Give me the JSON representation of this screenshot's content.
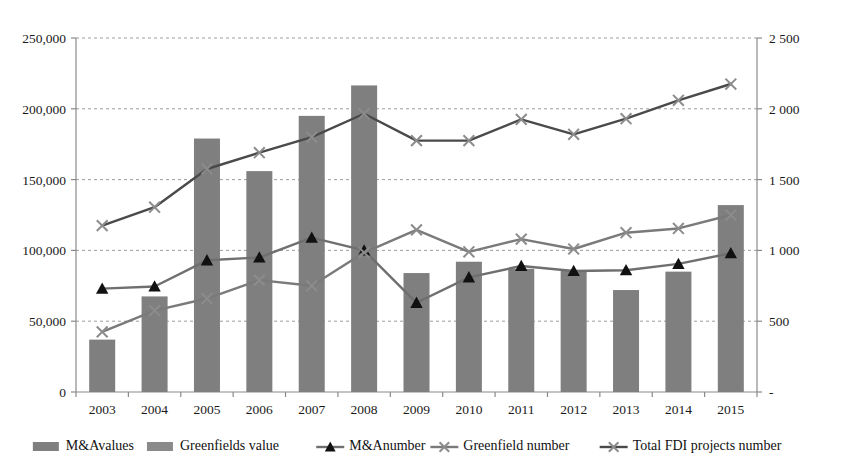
{
  "chart_data": {
    "type": "bar",
    "title": "",
    "subtitle": "",
    "xlabel": "",
    "ylabel": "",
    "grid": true,
    "legend_position": "bottom",
    "categories": [
      "2003",
      "2004",
      "2005",
      "2006",
      "2007",
      "2008",
      "2009",
      "2010",
      "2011",
      "2012",
      "2013",
      "2014",
      "2015"
    ],
    "axes": {
      "left": {
        "label": "",
        "ylim": [
          0,
          250000
        ],
        "ticks": [
          0,
          50000,
          100000,
          150000,
          200000,
          250000
        ],
        "tick_labels": [
          "0",
          "50,000",
          "100,000",
          "150,000",
          "200,000",
          "250,000"
        ]
      },
      "right": {
        "label": "",
        "ylim": [
          0,
          2500
        ],
        "ticks": [
          0,
          500,
          1000,
          1500,
          2000,
          2500
        ],
        "tick_labels": [
          "-",
          "500",
          "1 000",
          "1 500",
          "2 000",
          "2 500"
        ]
      }
    },
    "series": [
      {
        "name": "M&Avalues",
        "kind": "bar",
        "axis": "left",
        "color": "#7f7f7f",
        "values": [
          37000,
          67500,
          179000,
          156000,
          195000,
          216500,
          84000,
          92000,
          87000,
          86000,
          72000,
          85000,
          132000
        ]
      },
      {
        "name": "Greenfields value",
        "kind": "bar",
        "axis": "left",
        "color": "#8a8a8a",
        "values": [
          null,
          null,
          null,
          null,
          null,
          null,
          null,
          null,
          null,
          null,
          null,
          null,
          null
        ]
      },
      {
        "name": "M&Anumber",
        "kind": "line",
        "axis": "right",
        "color": "#6f6f6f",
        "marker": "triangle",
        "marker_color": "#111111",
        "values": [
          730,
          745,
          930,
          950,
          1090,
          1000,
          630,
          810,
          890,
          855,
          860,
          905,
          980
        ]
      },
      {
        "name": "Greenfield number",
        "kind": "line",
        "axis": "right",
        "color": "#7a7a7a",
        "marker": "x",
        "marker_color": "#8c8c8c",
        "values": [
          425,
          575,
          660,
          790,
          750,
          985,
          1145,
          990,
          1080,
          1010,
          1125,
          1155,
          1250
        ]
      },
      {
        "name": "Total FDI projects number",
        "kind": "line",
        "axis": "right",
        "color": "#4a4a4a",
        "marker": "x",
        "marker_color": "#8c8c8c",
        "values": [
          1175,
          1305,
          1575,
          1690,
          1800,
          1965,
          1775,
          1775,
          1925,
          1820,
          1930,
          2060,
          2175
        ]
      }
    ],
    "legend": [
      {
        "label": "M&Avalues",
        "type": "bar",
        "color": "#7f7f7f"
      },
      {
        "label": "Greenfields value",
        "type": "bar",
        "color": "#8a8a8a"
      },
      {
        "label": "M&Anumber",
        "type": "line-triangle",
        "color": "#6f6f6f",
        "marker_color": "#111111"
      },
      {
        "label": "Greenfield number",
        "type": "line-x",
        "color": "#7a7a7a",
        "marker_color": "#8c8c8c"
      },
      {
        "label": "Total FDI projects number",
        "type": "line-x",
        "color": "#4a4a4a",
        "marker_color": "#8c8c8c"
      }
    ]
  }
}
